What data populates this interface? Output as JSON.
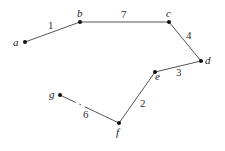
{
  "graph": {
    "nodes": [
      {
        "id": "a",
        "label": "a",
        "x": 25,
        "y": 42,
        "lx": 13,
        "ly": 46
      },
      {
        "id": "b",
        "label": "b",
        "x": 80,
        "y": 22,
        "lx": 77,
        "ly": 17
      },
      {
        "id": "c",
        "label": "c",
        "x": 169,
        "y": 22,
        "lx": 166,
        "ly": 17
      },
      {
        "id": "d",
        "label": "d",
        "x": 201,
        "y": 61,
        "lx": 205,
        "ly": 64
      },
      {
        "id": "e",
        "label": "e",
        "x": 155,
        "y": 72,
        "lx": 155,
        "ly": 80
      },
      {
        "id": "f",
        "label": "f",
        "x": 119,
        "y": 123,
        "lx": 116,
        "ly": 135
      },
      {
        "id": "g",
        "label": "g",
        "x": 60,
        "y": 95,
        "lx": 49,
        "ly": 98
      }
    ],
    "edges": [
      {
        "from": "a",
        "to": "b",
        "weight": "1",
        "wx": 48,
        "wy": 29
      },
      {
        "from": "b",
        "to": "c",
        "weight": "7",
        "wx": 121,
        "wy": 18
      },
      {
        "from": "c",
        "to": "d",
        "weight": "4",
        "wx": 187,
        "wy": 38
      },
      {
        "from": "d",
        "to": "e",
        "weight": "3",
        "wx": 176,
        "wy": 75
      },
      {
        "from": "e",
        "to": "f",
        "weight": "2",
        "wx": 140,
        "wy": 107
      },
      {
        "from": "f",
        "to": "g",
        "weight": "6",
        "wx": 83,
        "wy": 118
      }
    ]
  },
  "labels": {
    "a": "a",
    "b": "b",
    "c": "c",
    "d": "d",
    "e": "e",
    "f": "f",
    "g": "g",
    "w_ab": "1",
    "w_bc": "7",
    "w_cd": "4",
    "w_de": "3",
    "w_ef": "2",
    "w_fg": "6"
  }
}
